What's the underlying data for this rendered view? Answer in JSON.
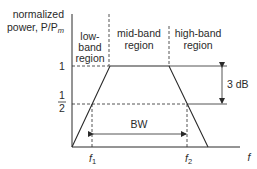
{
  "diagram": {
    "y_axis_label_line1": "normalized",
    "y_axis_label_line2": "power, P/P",
    "y_axis_label_sub": "m",
    "x_axis_label": "f",
    "y_ticks": {
      "one": "1",
      "half_num": "1",
      "half_den": "2"
    },
    "regions": [
      {
        "line1": "low-",
        "line2": "band",
        "line3": "region"
      },
      {
        "line1": "mid-band",
        "line2": "region"
      },
      {
        "line1": "high-band",
        "line2": "region"
      }
    ],
    "x_marks": {
      "f1": "f",
      "f1_sub": "1",
      "f2": "f",
      "f2_sub": "2"
    },
    "bandwidth_label": "BW",
    "db_label": "3 dB",
    "curve_points_normalized_power": [
      {
        "f": "0",
        "P": 0
      },
      {
        "f": "f1",
        "P": 0.5
      },
      {
        "f": "mid-band start",
        "P": 1
      },
      {
        "f": "mid-band end",
        "P": 1
      },
      {
        "f": "f2",
        "P": 0.5
      },
      {
        "f": "end",
        "P": 0
      }
    ],
    "colors": {
      "line": "#2a2a2a",
      "background": "#ffffff"
    }
  }
}
